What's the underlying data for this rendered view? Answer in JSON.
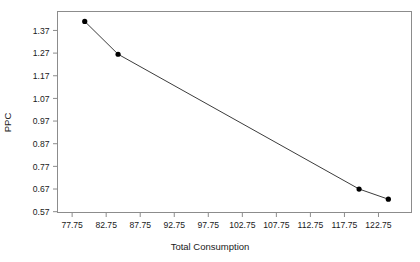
{
  "chart_data": {
    "type": "line",
    "title": "",
    "xlabel": "Total Consumption",
    "ylabel": "PPC",
    "x": [
      79.6,
      84.5,
      119.9,
      124.2
    ],
    "values": [
      1.41,
      1.265,
      0.67,
      0.625
    ],
    "series": [
      {
        "name": "PPC",
        "x": [
          79.6,
          84.5,
          119.9,
          124.2
        ],
        "values": [
          1.41,
          1.265,
          0.67,
          0.625
        ]
      }
    ],
    "xlim": [
      75.6,
      127.6
    ],
    "ylim": [
      0.5664,
      1.4536
    ],
    "xticks": [
      77.75,
      82.75,
      87.75,
      92.75,
      97.75,
      102.75,
      107.75,
      112.75,
      117.75,
      122.75
    ],
    "xtick_labels": [
      "77.75",
      "82.75",
      "87.75",
      "92.75",
      "97.75",
      "102.75",
      "107.75",
      "112.75",
      "117.75",
      "122.75"
    ],
    "yticks": [
      0.57,
      0.67,
      0.77,
      0.87,
      0.97,
      1.07,
      1.17,
      1.27,
      1.37
    ],
    "ytick_labels": [
      "0.57",
      "0.67",
      "0.77",
      "0.87",
      "0.97",
      "1.07",
      "1.17",
      "1.27",
      "1.37"
    ],
    "grid": false,
    "legend": "none",
    "marker": "filled-circle",
    "line_color": "#3c3c3c",
    "marker_color": "#000000",
    "frame_color": "#8c8c8c",
    "background": "#ffffff"
  }
}
